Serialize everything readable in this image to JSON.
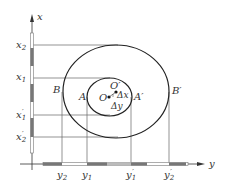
{
  "diagram": {
    "type": "displacement-projection",
    "colors": {
      "line": "#555555",
      "ellipse": "#222222",
      "bar_dark": "#777777",
      "bar_light": "#ffffff",
      "bar_mid": "#bbbbbb",
      "text": "#333333"
    },
    "axes": {
      "vertical": {
        "label": "x"
      },
      "horizontal": {
        "label": "y"
      }
    },
    "x_ticks": [
      {
        "id": "x2",
        "label": "x",
        "sub": "2"
      },
      {
        "id": "x1",
        "label": "x",
        "sub": "1"
      },
      {
        "id": "x1p",
        "label": "x",
        "sub": "1",
        "prime": "′"
      },
      {
        "id": "x2p",
        "label": "x",
        "sub": "2",
        "prime": "′"
      }
    ],
    "y_ticks": [
      {
        "id": "y2",
        "label": "y",
        "sub": "2"
      },
      {
        "id": "y1",
        "label": "y",
        "sub": "1"
      },
      {
        "id": "y1p",
        "label": "y",
        "sub": "1",
        "prime": "′"
      },
      {
        "id": "y2p",
        "label": "y",
        "sub": "2",
        "prime": "′"
      }
    ],
    "points": {
      "B": "B",
      "A": "A",
      "O": "O",
      "O_prime": "O′",
      "A_prime": "A′",
      "B_prime": "B′",
      "delta_x": "Δx",
      "delta_y": "Δy"
    },
    "shapes": {
      "outer_ellipse": "outer boundary B–B′",
      "inner_ellipse": "inner boundary A–A′"
    }
  }
}
